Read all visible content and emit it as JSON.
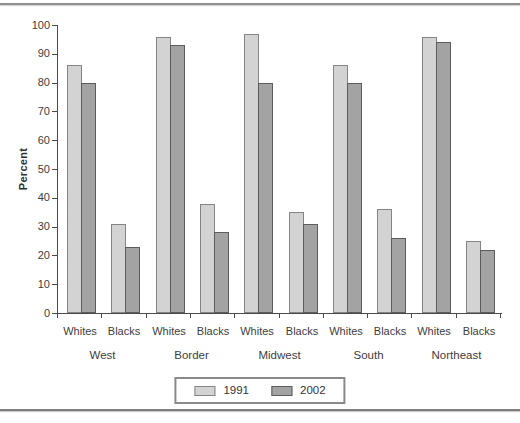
{
  "chart_data": {
    "type": "bar",
    "title": "",
    "xlabel": "",
    "ylabel": "Percent",
    "ylim": [
      0,
      100
    ],
    "yticks": [
      0,
      10,
      20,
      30,
      40,
      50,
      60,
      70,
      80,
      90,
      100
    ],
    "grid": false,
    "regions": [
      "West",
      "Border",
      "Midwest",
      "South",
      "Northeast"
    ],
    "group_labels": [
      "Whites",
      "Blacks"
    ],
    "categories": [
      "West Whites",
      "West Blacks",
      "Border Whites",
      "Border Blacks",
      "Midwest Whites",
      "Midwest Blacks",
      "South Whites",
      "South Blacks",
      "Northeast Whites",
      "Northeast Blacks"
    ],
    "series": [
      {
        "name": "1991",
        "fill": "#d3d3d3",
        "border": "#858585",
        "values": [
          86,
          31,
          96,
          38,
          97,
          35,
          86,
          36,
          96,
          25
        ]
      },
      {
        "name": "2002",
        "fill": "#a3a3a3",
        "border": "#5c5c5c",
        "values": [
          80,
          23,
          93,
          28,
          80,
          31,
          80,
          26,
          94,
          22
        ]
      }
    ],
    "legend": {
      "position": "bottom-center",
      "entries": [
        "1991",
        "2002"
      ]
    },
    "axis_color": "#4a4a4a",
    "text_color": "#3d3d3d"
  }
}
